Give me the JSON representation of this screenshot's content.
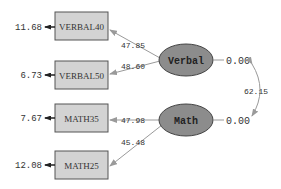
{
  "observed": [
    {
      "id": "VERBAL40",
      "label": "VERBAL40",
      "error": "11.68",
      "loading": "47.85",
      "factor": "Verbal"
    },
    {
      "id": "VERBAL50",
      "label": "VERBAL50",
      "error": "6.73",
      "loading": "48.60",
      "factor": "Verbal"
    },
    {
      "id": "MATH35",
      "label": "MATH35",
      "error": "7.67",
      "loading": "47.98",
      "factor": "Math"
    },
    {
      "id": "MATH25",
      "label": "MATH25",
      "error": "12.08",
      "loading": "45.48",
      "factor": "Math"
    }
  ],
  "latent": [
    {
      "id": "Verbal",
      "label": "Verbal",
      "variance": "0.00"
    },
    {
      "id": "Math",
      "label": "Math",
      "variance": "0.00"
    }
  ],
  "covariance": {
    "from": "Verbal",
    "to": "Math",
    "value": "62.15"
  },
  "colors": {
    "box_fill": "#d3d3d3",
    "box_stroke": "#555555",
    "ellipse_fill": "#8c8c8c",
    "ellipse_stroke": "#444444",
    "path_stroke": "#9a9a9a",
    "text": "#333333"
  }
}
